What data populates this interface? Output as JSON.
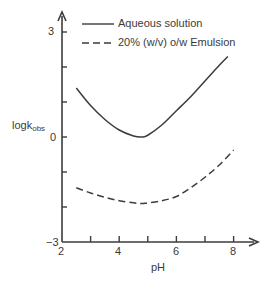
{
  "chart_data": {
    "type": "line",
    "title": "",
    "xlabel": "pH",
    "ylabel": "logk",
    "ylabel_subscript": "obs",
    "xlim": [
      2,
      8.8
    ],
    "ylim": [
      -3,
      3.8
    ],
    "x_ticks": [
      2,
      3,
      4,
      5,
      6,
      7,
      8
    ],
    "x_tick_labels": [
      "2",
      "4",
      "6",
      "8"
    ],
    "x_tick_label_values": [
      2,
      4,
      6,
      8
    ],
    "y_ticks": [
      -3,
      -2,
      -1,
      0,
      1,
      2,
      3
    ],
    "y_tick_labels": [
      "−3",
      "0",
      "3"
    ],
    "y_tick_label_values": [
      -3,
      0,
      3
    ],
    "grid": false,
    "legend_position": "top",
    "series": [
      {
        "name": "Aqueous solution",
        "style": "solid",
        "x": [
          2.5,
          3.0,
          3.5,
          4.0,
          4.5,
          4.8,
          5.0,
          5.5,
          6.0,
          6.5,
          7.0,
          7.5,
          7.8
        ],
        "y": [
          1.4,
          0.9,
          0.5,
          0.2,
          0.03,
          0.0,
          0.05,
          0.35,
          0.75,
          1.15,
          1.6,
          2.05,
          2.3
        ]
      },
      {
        "name": "20% (w/v) o/w Emulsion",
        "style": "dashed",
        "x": [
          2.5,
          3.0,
          3.5,
          4.0,
          4.5,
          4.8,
          5.0,
          5.5,
          6.0,
          6.5,
          7.0,
          7.5,
          8.0
        ],
        "y": [
          -1.45,
          -1.6,
          -1.72,
          -1.82,
          -1.88,
          -1.9,
          -1.88,
          -1.82,
          -1.7,
          -1.45,
          -1.15,
          -0.8,
          -0.37
        ]
      }
    ]
  }
}
